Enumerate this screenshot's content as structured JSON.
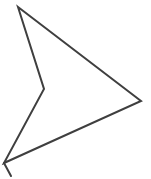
{
  "canvas": {
    "width": 151,
    "height": 179,
    "background_color": "#ffffff"
  },
  "drawing": {
    "description": "hand-drawn concave arrow/dart shape pointing right with small tail stroke at bottom-left corner",
    "stroke_color": "#3f3f3f",
    "stroke_width": 2,
    "fill": "none",
    "shapes": [
      {
        "name": "arrow-outline",
        "type": "polygon",
        "closed": true,
        "points": [
          [
            18,
            7
          ],
          [
            141,
            101
          ],
          [
            4,
            163
          ],
          [
            44,
            89
          ]
        ]
      },
      {
        "name": "tail-stroke",
        "type": "polyline",
        "closed": false,
        "points": [
          [
            4,
            163
          ],
          [
            11,
            176
          ]
        ]
      }
    ]
  }
}
